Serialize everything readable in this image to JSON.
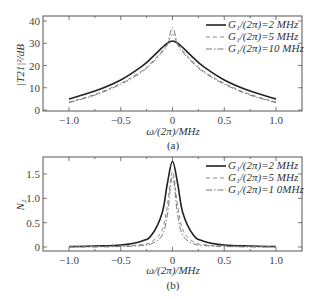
{
  "chart_data": [
    {
      "type": "line",
      "panel": "(a)",
      "title": "",
      "xlabel": "ω/(2π)/MHz",
      "ylabel": "|T21|²/dB",
      "xlim": [
        -1.2,
        1.25
      ],
      "ylim": [
        0,
        42
      ],
      "xticks": [
        -1.0,
        -0.5,
        0,
        0.5,
        1.0
      ],
      "xtick_labels": [
        "−1.0",
        "−0.5",
        "0",
        "0.5",
        "1.0"
      ],
      "yticks": [
        0,
        10,
        20,
        30,
        40
      ],
      "ytick_labels": [
        "0",
        "10",
        "20",
        "30",
        "40"
      ],
      "legend_position": "upper right",
      "x": [
        -1.0,
        -0.75,
        -0.5,
        -0.3,
        -0.2,
        -0.1,
        -0.05,
        0,
        0.05,
        0.1,
        0.2,
        0.3,
        0.5,
        0.75,
        1.0
      ],
      "series": [
        {
          "name": "G1/(2π)=2 MHz",
          "style": "solid",
          "values": [
            5.0,
            8.5,
            13.5,
            19.5,
            23.5,
            28.0,
            30.0,
            31.0,
            30.0,
            28.0,
            23.5,
            19.5,
            13.5,
            8.5,
            5.0
          ]
        },
        {
          "name": "G1/(2π)=5 MHz",
          "style": "dashed",
          "values": [
            3.6,
            7.0,
            12.0,
            17.5,
            21.5,
            26.5,
            29.5,
            34.0,
            29.5,
            26.5,
            21.5,
            17.5,
            12.0,
            7.0,
            3.6
          ]
        },
        {
          "name": "G1/(2π)=10 MHz",
          "style": "dashdot",
          "values": [
            3.3,
            6.7,
            11.6,
            17.0,
            21.0,
            26.0,
            29.5,
            37.0,
            29.5,
            26.0,
            21.0,
            17.0,
            11.6,
            6.7,
            3.3
          ]
        }
      ]
    },
    {
      "type": "line",
      "panel": "(b)",
      "title": "",
      "xlabel": "ω/(2π)/MHz",
      "ylabel": "N2",
      "xlim": [
        -1.2,
        1.25
      ],
      "ylim": [
        -0.05,
        1.9
      ],
      "xticks": [
        -1.0,
        -0.5,
        0,
        0.5,
        1.0
      ],
      "xtick_labels": [
        "−1.0",
        "−0.5",
        "0",
        "0.5",
        "1.0"
      ],
      "yticks": [
        0,
        0.5,
        1.0,
        1.5
      ],
      "ytick_labels": [
        "0",
        "0.5",
        "1.0",
        "1.5"
      ],
      "legend_position": "upper right",
      "x": [
        -1.0,
        -0.75,
        -0.5,
        -0.3,
        -0.2,
        -0.1,
        -0.05,
        0,
        0.05,
        0.1,
        0.2,
        0.3,
        0.5,
        0.75,
        1.0
      ],
      "series": [
        {
          "name": "G1/(2π)=2 MHz",
          "style": "solid",
          "values": [
            0.01,
            0.02,
            0.04,
            0.12,
            0.25,
            0.7,
            1.3,
            1.76,
            1.3,
            0.7,
            0.25,
            0.12,
            0.04,
            0.02,
            0.01
          ]
        },
        {
          "name": "G1/(2π)=5 MHz",
          "style": "dashed",
          "values": [
            0.0,
            0.01,
            0.02,
            0.05,
            0.11,
            0.35,
            0.85,
            1.55,
            0.85,
            0.35,
            0.11,
            0.05,
            0.02,
            0.01,
            0.0
          ]
        },
        {
          "name": "G1/(2π)=1 0MHz",
          "style": "dashdot",
          "values": [
            0.0,
            0.0,
            0.01,
            0.03,
            0.07,
            0.24,
            0.65,
            1.45,
            0.65,
            0.24,
            0.07,
            0.03,
            0.01,
            0.0,
            0.0
          ]
        }
      ]
    }
  ],
  "panels": {
    "a": {
      "caption": "(a)",
      "xlabel": "ω/(2π)/MHz",
      "ylabel": "|T21|²/dB",
      "legend": [
        "G₁/(2π)=2 MHz",
        "G₁/(2π)=5 MHz",
        "G₁/(2π)=10 MHz"
      ]
    },
    "b": {
      "caption": "(b)",
      "xlabel": "ω/(2π)/MHz",
      "ylabel": "N₂",
      "legend": [
        "G₁/(2π)=2 MHz",
        "G₁/(2π)=5 MHz",
        "G₁/(2π)=1 0MHz"
      ]
    }
  },
  "colors": {
    "solid": "#222222",
    "dashed": "#888888",
    "dashdot": "#777777",
    "frame": "#555555"
  }
}
